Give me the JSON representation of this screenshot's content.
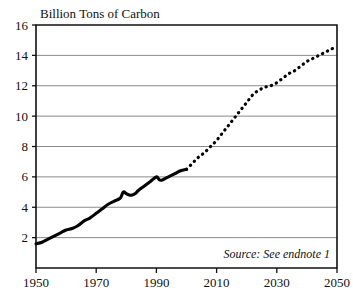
{
  "chart_data": {
    "type": "line",
    "title": "Billion Tons of Carbon",
    "xlabel": "",
    "ylabel": "Billion Tons of Carbon",
    "xlim": [
      1950,
      2050
    ],
    "ylim": [
      0,
      16
    ],
    "grid": true,
    "legend_position": "none",
    "x_ticks": [
      "1950",
      "1970",
      "1990",
      "2010",
      "2030",
      "2050"
    ],
    "x_tick_values": [
      1950,
      1970,
      1990,
      2010,
      2030,
      2050
    ],
    "y_ticks": [
      "2",
      "4",
      "6",
      "8",
      "10",
      "12",
      "14",
      "16"
    ],
    "y_tick_values": [
      2,
      4,
      6,
      8,
      10,
      12,
      14,
      16
    ],
    "annotations": [
      {
        "name": "source-note",
        "text": "Source: See endnote 1"
      }
    ],
    "series": [
      {
        "name": "Historical carbon emissions",
        "style": "solid",
        "x": [
          1950,
          1952,
          1954,
          1956,
          1958,
          1960,
          1962,
          1964,
          1966,
          1968,
          1970,
          1972,
          1974,
          1976,
          1978,
          1979,
          1980,
          1981,
          1982,
          1983,
          1984,
          1986,
          1988,
          1990,
          1991,
          1992,
          1993,
          1994,
          1996,
          1998,
          2000
        ],
        "values": [
          1.6,
          1.7,
          1.9,
          2.1,
          2.3,
          2.5,
          2.6,
          2.8,
          3.1,
          3.3,
          3.6,
          3.9,
          4.2,
          4.4,
          4.6,
          5.0,
          4.9,
          4.8,
          4.8,
          4.9,
          5.1,
          5.4,
          5.7,
          6.0,
          5.8,
          5.8,
          5.9,
          6.0,
          6.2,
          6.4,
          6.5
        ]
      },
      {
        "name": "Projected carbon emissions",
        "style": "dotted",
        "x": [
          2000,
          2002,
          2004,
          2006,
          2008,
          2010,
          2012,
          2014,
          2016,
          2018,
          2020,
          2022,
          2024,
          2026,
          2028,
          2030,
          2032,
          2034,
          2036,
          2038,
          2040,
          2042,
          2044,
          2046,
          2048,
          2050
        ],
        "values": [
          6.5,
          6.9,
          7.3,
          7.6,
          8.0,
          8.4,
          8.9,
          9.4,
          9.9,
          10.4,
          10.9,
          11.4,
          11.7,
          11.9,
          12.0,
          12.2,
          12.5,
          12.8,
          13.0,
          13.3,
          13.6,
          13.8,
          14.0,
          14.2,
          14.4,
          14.6
        ]
      }
    ]
  },
  "colors": {
    "series_line": "#050505",
    "gridline": "#8a8a8a",
    "frame": "#111111",
    "background": "#ffffff",
    "text": "#111111"
  },
  "layout": {
    "plot_left": 36,
    "plot_right": 337,
    "plot_top": 25,
    "plot_bottom": 268
  }
}
